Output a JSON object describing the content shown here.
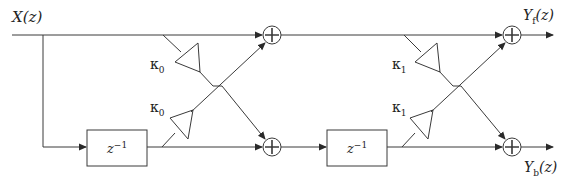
{
  "diagram": {
    "type": "lattice filter block diagram",
    "input": {
      "label_main": "X",
      "label_arg": "(z)"
    },
    "outputs": {
      "forward": {
        "label_main": "Y",
        "label_sub": "f",
        "label_arg": "(z)"
      },
      "backward": {
        "label_main": "Y",
        "label_sub": "b",
        "label_arg": "(z)"
      }
    },
    "stages": [
      {
        "delay": {
          "base": "z",
          "exp": "−1"
        },
        "coefficients": [
          {
            "symbol": "κ",
            "sub": "0"
          },
          {
            "symbol": "κ",
            "sub": "0"
          }
        ]
      },
      {
        "delay": {
          "base": "z",
          "exp": "−1"
        },
        "coefficients": [
          {
            "symbol": "κ",
            "sub": "1"
          },
          {
            "symbol": "κ",
            "sub": "1"
          }
        ]
      }
    ],
    "adder_symbol": "+",
    "line_color": "#3a3a3a"
  }
}
